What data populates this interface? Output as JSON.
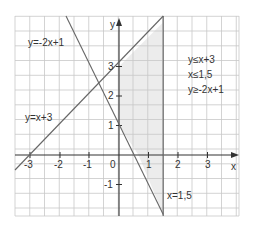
{
  "figure": {
    "axis_x_label": "x",
    "axis_y_label": "y",
    "x_ticks": [
      "-3",
      "-2",
      "-1",
      "0",
      "1",
      "2",
      "3"
    ],
    "y_ticks": [
      "3",
      "2",
      "1",
      "-1"
    ],
    "lines": [
      {
        "label": "y=-2x+1"
      },
      {
        "label": "y=x+3"
      },
      {
        "label": "x=1,5"
      }
    ],
    "inequalities": [
      "y≤x+3",
      "x≤1,5",
      "y≥-2x+1"
    ],
    "colors": {
      "grid": "#c8c8c8",
      "line": "#666666",
      "shade": "#ececec",
      "axis": "#333333"
    }
  }
}
